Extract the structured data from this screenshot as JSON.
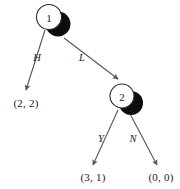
{
  "diagram": {
    "type": "extensive-form-game-tree",
    "background_color": "#ffffff",
    "edge_color": "#555555",
    "node_fill": "#ffffff",
    "node_stroke": "#2b2b2b",
    "shadow_color": "#0d0d0d",
    "text_color": "#1a1a1a",
    "nodes": [
      {
        "id": "node-1",
        "label": "1",
        "cx": 49,
        "cy": 17,
        "r": 12.5,
        "shadow_cx": 58,
        "shadow_cy": 24,
        "shadow_r": 12.5
      },
      {
        "id": "node-2",
        "label": "2",
        "cx": 122,
        "cy": 96,
        "r": 12,
        "shadow_cx": 131,
        "shadow_cy": 103,
        "shadow_r": 12
      }
    ],
    "edges": [
      {
        "id": "edge-h",
        "label": "H",
        "from": "node-1",
        "x1": 45,
        "y1": 30,
        "x2": 26,
        "y2": 90,
        "label_x": 37,
        "label_y": 57
      },
      {
        "id": "edge-l",
        "label": "L",
        "from": "node-1",
        "x1": 64,
        "y1": 38,
        "x2": 118,
        "y2": 79,
        "label_x": 82,
        "label_y": 57
      },
      {
        "id": "edge-y",
        "label": "Y",
        "from": "node-2",
        "x1": 118,
        "y1": 110,
        "x2": 93,
        "y2": 165,
        "label_x": 101,
        "label_y": 138
      },
      {
        "id": "edge-n",
        "label": "N",
        "from": "node-2",
        "x1": 128,
        "y1": 110,
        "x2": 157,
        "y2": 165,
        "label_x": 133,
        "label_y": 138
      }
    ],
    "payoffs": [
      {
        "id": "payoff-h",
        "text": "(2, 2)",
        "values": [
          2,
          2
        ],
        "x": 26,
        "y": 103,
        "terminal_of": "edge-h"
      },
      {
        "id": "payoff-y",
        "text": "(3, 1)",
        "values": [
          3,
          1
        ],
        "x": 93,
        "y": 177,
        "terminal_of": "edge-y"
      },
      {
        "id": "payoff-n",
        "text": "(0, 0)",
        "values": [
          0,
          0
        ],
        "x": 161,
        "y": 177,
        "terminal_of": "edge-n"
      }
    ]
  }
}
